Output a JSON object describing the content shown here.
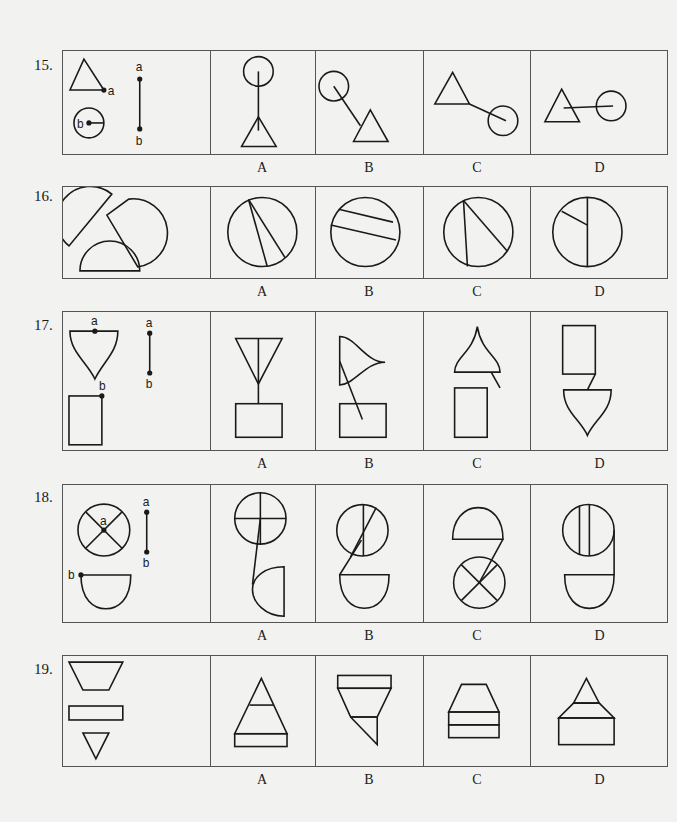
{
  "problems": [
    {
      "number": "15.",
      "stem_labels": [
        "a",
        "b",
        "a",
        "b"
      ],
      "options": [
        "A",
        "B",
        "C",
        "D"
      ]
    },
    {
      "number": "16.",
      "options": [
        "A",
        "B",
        "C",
        "D"
      ]
    },
    {
      "number": "17.",
      "stem_labels": [
        "a",
        "b",
        "a",
        "b"
      ],
      "options": [
        "A",
        "B",
        "C",
        "D"
      ]
    },
    {
      "number": "18.",
      "stem_labels": [
        "a",
        "b",
        "a",
        "b"
      ],
      "options": [
        "A",
        "B",
        "C",
        "D"
      ]
    },
    {
      "number": "19.",
      "options": [
        "A",
        "B",
        "C",
        "D"
      ]
    }
  ]
}
